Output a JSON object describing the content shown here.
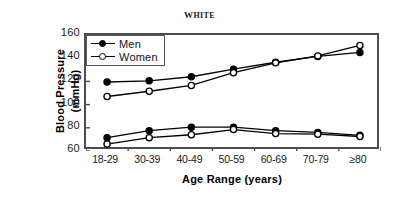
{
  "chart_data": {
    "type": "line",
    "title": "WHITE",
    "xlabel": "Age  Range  (years)",
    "ylabel_line1": "Blood  Pressure",
    "ylabel_line2": "(mmHg)",
    "categories": [
      "18-29",
      "30-39",
      "40-49",
      "50-59",
      "60-69",
      "70-79",
      "≥80"
    ],
    "ylim": [
      60,
      160
    ],
    "yticks": [
      60,
      80,
      100,
      120,
      140,
      160
    ],
    "grid": false,
    "legend_position": "top-left",
    "series": [
      {
        "name": "Men",
        "marker": "filled-circle",
        "color": "#000000",
        "measure": "systolic",
        "values": [
          119.5,
          120.5,
          124,
          130.5,
          136.5,
          141.5,
          145
        ]
      },
      {
        "name": "Women",
        "marker": "open-circle",
        "color": "#000000",
        "measure": "systolic",
        "values": [
          107,
          111.5,
          116.5,
          127.5,
          136,
          142,
          151
        ]
      },
      {
        "name": "Men",
        "marker": "filled-circle",
        "color": "#000000",
        "measure": "diastolic",
        "values": [
          71.5,
          77.5,
          80.5,
          80.5,
          77.5,
          76,
          73.5
        ]
      },
      {
        "name": "Women",
        "marker": "open-circle",
        "color": "#000000",
        "measure": "diastolic",
        "values": [
          66,
          71.5,
          74,
          78.5,
          75,
          74.5,
          72.5
        ]
      }
    ],
    "legend": [
      {
        "label": "Men",
        "marker": "filled-circle"
      },
      {
        "label": "Women",
        "marker": "open-circle"
      }
    ]
  }
}
